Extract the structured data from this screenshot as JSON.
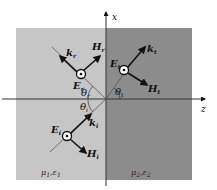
{
  "diagram": {
    "axes": {
      "vertical": "x",
      "horizontal": "z"
    },
    "regions": [
      {
        "id": "medium1",
        "label_mu": "μ",
        "label_mu_sub": "1",
        "label_eps": "ε",
        "label_eps_sub": "1",
        "color": "#c6c6c6"
      },
      {
        "id": "medium2",
        "label_mu": "μ",
        "label_mu_sub": "2",
        "label_eps": "ε",
        "label_eps_sub": "2",
        "color": "#8c8c8c"
      }
    ],
    "waves": {
      "incident": {
        "k": "k",
        "k_sub": "i",
        "E": "E",
        "E_sub": "i",
        "H": "H",
        "H_sub": "i",
        "theta": "θ",
        "theta_sub": "i"
      },
      "reflected": {
        "k": "k",
        "k_sub": "r",
        "E": "E",
        "E_sub": "r",
        "H": "H",
        "H_sub": "r",
        "theta": "θ",
        "theta_sub": "r"
      },
      "transmitted": {
        "k": "k",
        "k_sub": "t",
        "E": "E",
        "E_sub": "t",
        "H": "H",
        "H_sub": "t",
        "theta": "θ",
        "theta_sub": "t"
      }
    },
    "colors": {
      "medium1": "#c6c6c6",
      "medium2": "#8c8c8c",
      "ink": "#111111",
      "line": "#444444"
    }
  }
}
